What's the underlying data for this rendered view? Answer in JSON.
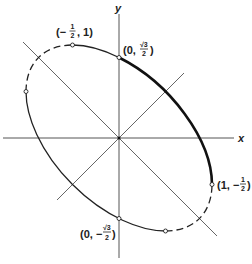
{
  "diagram": {
    "type": "rotated ellipse with coordinate axes",
    "equation_hint": "x^2 + xy + y^2 = 3/4",
    "axes": {
      "x_label": "x",
      "y_label": "y"
    },
    "lines": [
      "y = x",
      "y = -x"
    ],
    "labeled_points": [
      {
        "id": "p1",
        "label": "(−½, 1)",
        "x": -0.5,
        "y": 1
      },
      {
        "id": "p2",
        "label": "(0, √3⁄2)",
        "x": 0,
        "y": 0.866
      },
      {
        "id": "p3",
        "label": "(1, −½)",
        "x": 1,
        "y": -0.5
      },
      {
        "id": "p4",
        "label": "(0, −√3⁄2)",
        "x": 0,
        "y": -0.866
      }
    ],
    "unlabeled_points": [
      {
        "x": -1,
        "y": 0.5
      },
      {
        "x": 0.5,
        "y": -1
      }
    ],
    "arcs": [
      {
        "from": "(0, √3/2)",
        "to": "(1, −1/2)",
        "style": "thick solid"
      },
      {
        "from": "(−1/2, 1)",
        "to": "(0, √3/2)",
        "style": "solid"
      },
      {
        "from": "(−1, 1/2)",
        "to": "(−1/2, 1)",
        "style": "dashed"
      },
      {
        "from": "(−1, 1/2)",
        "to": "(1/2, −1)",
        "style": "solid"
      },
      {
        "from": "(1/2, −1)",
        "to": "(1, −1/2)",
        "style": "dashed"
      }
    ],
    "text": {
      "x_axis": "x",
      "y_axis": "y",
      "p1_open": "(−",
      "p1_num": "1",
      "p1_den": "2",
      "p1_close": ", 1)",
      "p2_open": "(0,",
      "p2_num": "√3",
      "p2_den": "2",
      "p2_close": ")",
      "p3_open": "(1, −",
      "p3_num": "1",
      "p3_den": "2",
      "p3_close": ")",
      "p4_open": "(0, −",
      "p4_num": "√3",
      "p4_den": "2",
      "p4_close": ")"
    }
  }
}
